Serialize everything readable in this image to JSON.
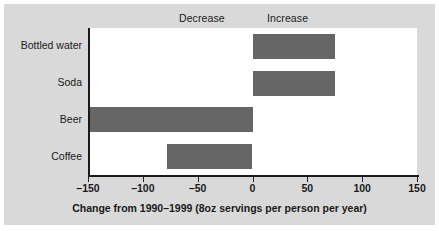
{
  "chart_data": {
    "type": "bar",
    "orientation": "horizontal",
    "title": "",
    "subtitle": "",
    "xlabel": "Change from 1990–1999 (8oz servings per person per year)",
    "ylabel": "",
    "categories": [
      "Bottled water",
      "Soda",
      "Beer",
      "Coffee"
    ],
    "values": [
      75,
      75,
      -150,
      -78
    ],
    "series": [
      {
        "name": "Change from 1990–1999",
        "values": [
          75,
          75,
          -150,
          -78
        ]
      }
    ],
    "xlim": [
      -150,
      150
    ],
    "xticks": [
      -150,
      -100,
      -50,
      0,
      50,
      100,
      150
    ],
    "xticklabels": [
      "–150",
      "–100",
      "–50",
      "0",
      "50",
      "100",
      "150"
    ],
    "grid": false,
    "legend": false,
    "legend_position": "none",
    "annotations": [
      {
        "text": "Decrease",
        "side": "left"
      },
      {
        "text": "Increase",
        "side": "right"
      }
    ],
    "bar_color": "#666666",
    "plot_background": "#ffffff",
    "figure_background": "#d9d9d9",
    "axis_color": "#1a1a1a"
  },
  "chart": {
    "decrease_label": "Decrease",
    "increase_label": "Increase",
    "axis_title": "Change from 1990–1999 (8oz servings per person per year)"
  }
}
